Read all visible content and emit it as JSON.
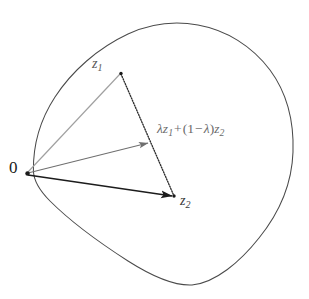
{
  "figure": {
    "kind": "convex-set-diagram",
    "width": 309,
    "height": 299,
    "background_color": "#ffffff",
    "labels": {
      "origin": "0",
      "point_z1_base": "z",
      "point_z1_sub": "1",
      "point_z2_base": "z",
      "point_z2_sub": "2",
      "combination": {
        "lambda": "λ",
        "z_base": "z",
        "z1_sub": "1",
        "plus": "+",
        "open_paren": "(",
        "one": "1",
        "minus": "−",
        "close_paren": ")",
        "z2_sub": "2",
        "full_text": "λz₁ + (1 − λ)z₂"
      }
    },
    "colors": {
      "blob_stroke": "#4a4a4a",
      "ray_to_z1": "#9a9a9a",
      "ray_to_combination": "#787878",
      "ray_to_z2": "#1c1c1c",
      "chord_dotted": "#2e2e2e",
      "vertex_dot": "#1a1a1a",
      "label_gray": "#5a5a5a",
      "label_dark": "#1a1a1a"
    },
    "points": {
      "origin": {
        "x": 27,
        "y": 173
      },
      "z1": {
        "x": 121,
        "y": 73
      },
      "z2": {
        "x": 174,
        "y": 196
      },
      "combination": {
        "x": 150,
        "y": 143
      }
    },
    "blob_outline_path": "M 33.5 170 C 34 130 52 90 82 62 C 112 34 148 22 180 24 C 216 26 252 46 272 74 C 292 102 295 130 293 156 C 291 186 276 218 252 244 C 230 268 206 285 184 284 C 160 283 132 262 104 240 C 76 218 50 202 38 188 C 32 181 33.2 176 33.5 170 Z",
    "elements": [
      {
        "name": "convex-set-boundary",
        "type": "closed-curve"
      },
      {
        "name": "ray-origin-to-z1",
        "type": "segment",
        "from": "origin",
        "to": "z1",
        "arrowhead": false
      },
      {
        "name": "ray-origin-to-combination",
        "type": "segment",
        "from": "origin",
        "to": "combination",
        "arrowhead": true
      },
      {
        "name": "ray-origin-to-z2",
        "type": "segment",
        "from": "origin",
        "to": "z2",
        "arrowhead": true
      },
      {
        "name": "chord-z1-to-z2",
        "type": "dotted-segment",
        "from": "z1",
        "to": "z2",
        "arrowhead": false
      }
    ]
  }
}
